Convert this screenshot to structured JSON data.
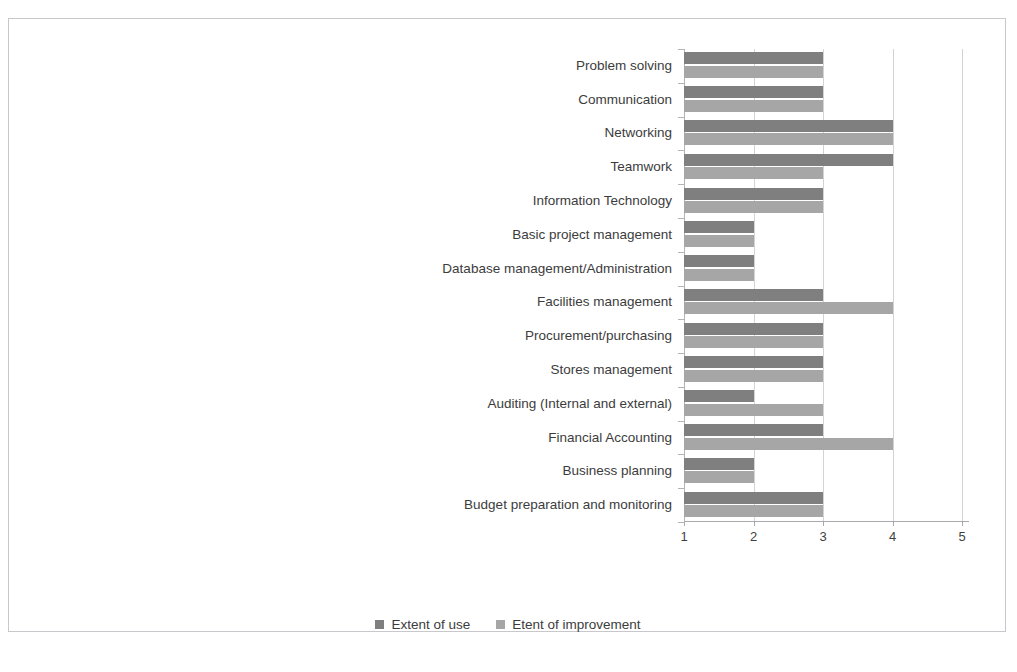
{
  "page": {
    "bleed_text_top": "",
    "caption": ""
  },
  "legend": {
    "position": "bottom",
    "items": [
      {
        "label": "Extent of use",
        "color": "#7f7f7f"
      },
      {
        "label": "Etent of improvement",
        "color": "#a6a6a6"
      }
    ]
  },
  "axis": {
    "ticks": [
      "1",
      "2",
      "3",
      "4",
      "5"
    ]
  },
  "chart_data": {
    "type": "bar",
    "orientation": "horizontal",
    "title": "",
    "xlabel": "",
    "ylabel": "",
    "xlim": [
      1,
      5
    ],
    "grid": true,
    "legend_position": "bottom",
    "tick_labels": [
      "1",
      "2",
      "3",
      "4",
      "5"
    ],
    "categories": [
      "Problem solving",
      "Communication",
      "Networking",
      "Teamwork",
      "Information Technology",
      "Basic project management",
      "Database management/Administration",
      "Facilities management",
      "Procurement/purchasing",
      "Stores management",
      "Auditing (Internal and external)",
      "Financial Accounting",
      "Business planning",
      "Budget preparation and monitoring"
    ],
    "series": [
      {
        "name": "Extent of use",
        "color": "#7f7f7f",
        "values": [
          3,
          3,
          4,
          4,
          3,
          2,
          2,
          3,
          3,
          3,
          2,
          3,
          2,
          3
        ]
      },
      {
        "name": "Etent of improvement",
        "color": "#a6a6a6",
        "values": [
          3,
          3,
          4,
          3,
          3,
          2,
          2,
          4,
          3,
          3,
          3,
          4,
          2,
          3
        ]
      }
    ]
  }
}
